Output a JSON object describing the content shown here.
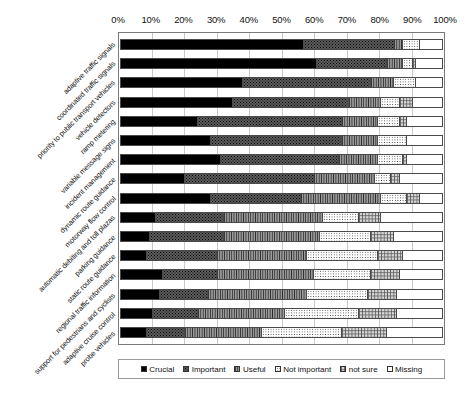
{
  "chart_data": {
    "type": "bar",
    "subtype": "stacked-horizontal-100percent",
    "title": "",
    "xlabel": "",
    "ylabel": "",
    "xlim": [
      0,
      100
    ],
    "xticks": [
      0,
      10,
      20,
      30,
      40,
      50,
      60,
      70,
      80,
      90,
      100
    ],
    "xticklabels": [
      "0%",
      "10%",
      "20%",
      "30%",
      "40%",
      "50%",
      "60%",
      "70%",
      "80%",
      "90%",
      "100%"
    ],
    "grid": true,
    "grid_axis": "x",
    "legend_position": "bottom",
    "categories": [
      "adaptive traffic signals",
      "coordinated traffic signals",
      "priority to public transport vehicles",
      "vehicle detectors",
      "ramp metering",
      "variable message signs",
      "incident management",
      "dynamic route guidance",
      "motorway flow control",
      "automatic debiting and toll plazas",
      "parking guidance",
      "static route guidance",
      "regional traffic information",
      "support for pedestrians and cyclists",
      "adaptive cruise control",
      "probe vehicles"
    ],
    "series": [
      {
        "name": "Crucial",
        "fill": "f-crucial",
        "values": [
          57,
          61,
          38,
          35,
          24,
          28,
          31,
          20,
          28,
          11,
          9,
          8,
          13,
          12,
          10,
          8
        ]
      },
      {
        "name": "Important",
        "fill": "f-important",
        "values": [
          28,
          22,
          40,
          36,
          45,
          41,
          37,
          40,
          28,
          21,
          23,
          22,
          17,
          15,
          14,
          12
        ]
      },
      {
        "name": "Useful",
        "fill": "f-useful",
        "values": [
          3,
          5,
          7,
          10,
          11,
          11,
          12,
          19,
          25,
          31,
          30,
          28,
          30,
          31,
          27,
          24
        ]
      },
      {
        "name": "Not important",
        "fill": "f-notimportant",
        "values": [
          5,
          3,
          7,
          6,
          7,
          9,
          8,
          5,
          8,
          11,
          16,
          22,
          18,
          19,
          23,
          25
        ]
      },
      {
        "name": "not sure",
        "fill": "f-notsure",
        "values": [
          0,
          1,
          0,
          4,
          2,
          0,
          1,
          3,
          4,
          7,
          7,
          8,
          9,
          9,
          12,
          14
        ]
      },
      {
        "name": "Missing",
        "fill": "f-missing",
        "values": [
          7,
          8,
          8,
          9,
          11,
          11,
          11,
          13,
          7,
          19,
          15,
          12,
          13,
          14,
          14,
          17
        ]
      }
    ]
  },
  "legend": {
    "items": [
      {
        "label": "Crucial",
        "fill": "f-crucial"
      },
      {
        "label": "Important",
        "fill": "f-important"
      },
      {
        "label": "Useful",
        "fill": "f-useful"
      },
      {
        "label": "Not important",
        "fill": "f-notimportant"
      },
      {
        "label": "not sure",
        "fill": "f-notsure"
      },
      {
        "label": "Missing",
        "fill": "f-missing"
      }
    ]
  }
}
